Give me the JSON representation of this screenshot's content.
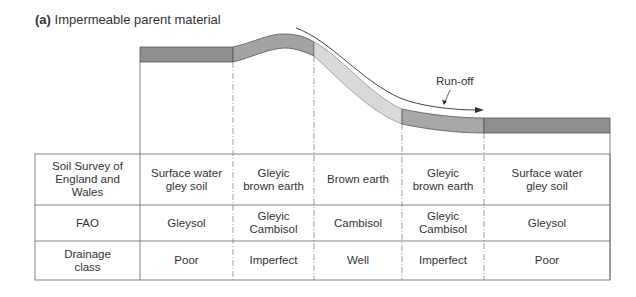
{
  "title": {
    "label": "(a)",
    "text": "Impermeable parent material"
  },
  "annotation": {
    "runoff": "Run-off"
  },
  "colors": {
    "dark_band": "#8f8f8f",
    "mid_band": "#a8a8a8",
    "light_band": "#d8d8d8",
    "lines": "#555555"
  },
  "table": {
    "rows": [
      {
        "header": "Soil Survey of\nEngland and\nWales",
        "cells": [
          "Surface water\ngley soil",
          "Gleyic\nbrown earth",
          "Brown earth",
          "Gleyic\nbrown earth",
          "Surface water\ngley soil"
        ]
      },
      {
        "header": "FAO",
        "cells": [
          "Gleysol",
          "Gleyic\nCambisol",
          "Cambisol",
          "Gleyic\nCambisol",
          "Gleysol"
        ]
      },
      {
        "header": "Drainage\nclass",
        "cells": [
          "Poor",
          "Imperfect",
          "Well",
          "Imperfect",
          "Poor"
        ]
      }
    ]
  }
}
